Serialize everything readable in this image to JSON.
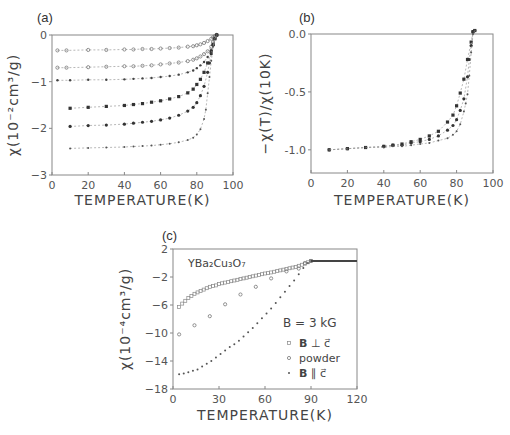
{
  "figure": {
    "panels": [
      {
        "id": "a",
        "label": "(a)"
      },
      {
        "id": "b",
        "label": "(b)"
      },
      {
        "id": "c",
        "label": "(c)"
      }
    ]
  },
  "chart_data": [
    {
      "id": "a",
      "type": "scatter",
      "title": "(a)",
      "xlabel": "TEMPERATURE(K)",
      "ylabel": "χ(10⁻²cm³/g)",
      "xlim": [
        0,
        100
      ],
      "ylim": [
        -3,
        0
      ],
      "xticks": [
        0,
        20,
        40,
        60,
        80,
        100
      ],
      "yticks": [
        0,
        -1,
        -2,
        -3
      ],
      "grid": false,
      "series": [
        {
          "name": "curve-1",
          "marker": "open-circle",
          "x": [
            3,
            8,
            20,
            30,
            40,
            45,
            50,
            55,
            60,
            65,
            70,
            75,
            78,
            80,
            82,
            84,
            86,
            88,
            89,
            90,
            91
          ],
          "y": [
            -0.33,
            -0.33,
            -0.32,
            -0.32,
            -0.31,
            -0.31,
            -0.3,
            -0.3,
            -0.29,
            -0.28,
            -0.27,
            -0.25,
            -0.24,
            -0.22,
            -0.2,
            -0.17,
            -0.13,
            -0.08,
            -0.05,
            -0.02,
            0.0
          ]
        },
        {
          "name": "curve-2",
          "marker": "open-circle",
          "x": [
            3,
            8,
            20,
            30,
            40,
            45,
            50,
            55,
            60,
            65,
            70,
            75,
            78,
            80,
            82,
            84,
            86,
            88,
            89,
            90,
            91
          ],
          "y": [
            -0.7,
            -0.7,
            -0.69,
            -0.68,
            -0.67,
            -0.67,
            -0.66,
            -0.65,
            -0.63,
            -0.61,
            -0.59,
            -0.56,
            -0.53,
            -0.5,
            -0.46,
            -0.41,
            -0.35,
            -0.25,
            -0.15,
            -0.05,
            0.0
          ]
        },
        {
          "name": "curve-3",
          "marker": "dot",
          "x": [
            3,
            10,
            20,
            30,
            40,
            45,
            50,
            55,
            60,
            65,
            70,
            75,
            78,
            80,
            82,
            84,
            86,
            88,
            89,
            90,
            91
          ],
          "y": [
            -0.97,
            -0.97,
            -0.96,
            -0.96,
            -0.95,
            -0.94,
            -0.93,
            -0.92,
            -0.9,
            -0.88,
            -0.85,
            -0.8,
            -0.76,
            -0.71,
            -0.65,
            -0.58,
            -0.47,
            -0.32,
            -0.2,
            -0.08,
            0.0
          ]
        },
        {
          "name": "curve-4",
          "marker": "filled-square",
          "x": [
            10,
            20,
            30,
            40,
            45,
            50,
            55,
            60,
            65,
            70,
            75,
            78,
            80,
            82,
            84,
            86,
            88,
            89,
            90,
            91
          ],
          "y": [
            -1.57,
            -1.55,
            -1.53,
            -1.51,
            -1.49,
            -1.47,
            -1.44,
            -1.41,
            -1.37,
            -1.32,
            -1.24,
            -1.16,
            -1.06,
            -0.95,
            -0.8,
            -0.6,
            -0.35,
            -0.2,
            -0.08,
            0.0
          ]
        },
        {
          "name": "curve-5",
          "marker": "filled-circle",
          "x": [
            10,
            20,
            30,
            40,
            45,
            50,
            55,
            60,
            65,
            70,
            75,
            78,
            80,
            82,
            84,
            86,
            87,
            88,
            89,
            90,
            91
          ],
          "y": [
            -1.96,
            -1.94,
            -1.93,
            -1.91,
            -1.89,
            -1.87,
            -1.85,
            -1.82,
            -1.78,
            -1.72,
            -1.63,
            -1.55,
            -1.45,
            -1.3,
            -1.1,
            -0.8,
            -0.6,
            -0.4,
            -0.22,
            -0.08,
            0.0
          ]
        },
        {
          "name": "curve-6",
          "marker": "small-dot",
          "x": [
            10,
            20,
            30,
            40,
            45,
            50,
            55,
            60,
            65,
            70,
            75,
            78,
            80,
            82,
            84,
            85,
            86,
            87,
            88,
            89,
            90,
            91
          ],
          "y": [
            -2.43,
            -2.42,
            -2.41,
            -2.4,
            -2.39,
            -2.38,
            -2.37,
            -2.35,
            -2.33,
            -2.3,
            -2.25,
            -2.2,
            -2.13,
            -2.02,
            -1.8,
            -1.6,
            -1.25,
            -0.9,
            -0.55,
            -0.25,
            -0.08,
            0.0
          ]
        }
      ]
    },
    {
      "id": "b",
      "type": "scatter",
      "title": "(b)",
      "xlabel": "TEMPERATURE(K)",
      "ylabel": "−χ(T)/χ(10K)",
      "xlim": [
        0,
        100
      ],
      "ylim": [
        -1.2,
        0.0
      ],
      "xticks": [
        0,
        20,
        40,
        60,
        80,
        100
      ],
      "yticks": [
        0.0,
        -0.5,
        -1.0
      ],
      "ytick_labels": [
        "0.0",
        "-0.5",
        "-1.0"
      ],
      "grid": false,
      "series": [
        {
          "name": "normalized-1",
          "marker": "filled-square",
          "x": [
            10,
            20,
            30,
            40,
            45,
            50,
            55,
            60,
            65,
            70,
            75,
            78,
            80,
            82,
            84,
            86,
            88,
            89,
            90
          ],
          "y": [
            -1.0,
            -0.99,
            -0.98,
            -0.97,
            -0.96,
            -0.95,
            -0.93,
            -0.91,
            -0.88,
            -0.84,
            -0.76,
            -0.7,
            -0.62,
            -0.51,
            -0.39,
            -0.22,
            -0.07,
            0.02,
            0.03
          ]
        },
        {
          "name": "normalized-2",
          "marker": "filled-circle",
          "x": [
            10,
            20,
            30,
            40,
            45,
            50,
            55,
            60,
            65,
            70,
            75,
            78,
            80,
            82,
            84,
            86,
            87,
            88,
            89,
            90
          ],
          "y": [
            -1.0,
            -0.99,
            -0.98,
            -0.97,
            -0.96,
            -0.96,
            -0.94,
            -0.93,
            -0.91,
            -0.88,
            -0.83,
            -0.79,
            -0.74,
            -0.66,
            -0.56,
            -0.37,
            -0.22,
            -0.1,
            0.02,
            0.03
          ]
        },
        {
          "name": "normalized-3",
          "marker": "small-dot",
          "x": [
            10,
            20,
            30,
            40,
            45,
            50,
            55,
            60,
            65,
            70,
            75,
            78,
            80,
            82,
            84,
            85,
            86,
            87,
            88,
            89,
            90
          ],
          "y": [
            -1.0,
            -0.99,
            -0.98,
            -0.98,
            -0.97,
            -0.97,
            -0.96,
            -0.95,
            -0.94,
            -0.92,
            -0.9,
            -0.87,
            -0.84,
            -0.78,
            -0.67,
            -0.6,
            -0.52,
            -0.36,
            -0.16,
            0.0,
            0.03
          ]
        }
      ]
    },
    {
      "id": "c",
      "type": "scatter",
      "title": "(c)",
      "annotation": "YBa₂Cu₃O₇",
      "xlabel": "TEMPERATURE(K)",
      "ylabel": "χ(10⁻⁴cm³/g)",
      "xlim": [
        0,
        120
      ],
      "ylim": [
        -18,
        2
      ],
      "xticks": [
        0,
        30,
        60,
        90,
        120
      ],
      "yticks": [
        2,
        -2,
        -6,
        -10,
        -14,
        -18
      ],
      "grid": false,
      "legend": {
        "title": "B = 3 kG",
        "position": "lower-right",
        "entries": [
          {
            "marker": "open-square",
            "label_bold": "B",
            "label_rest": " ⊥ c⃗"
          },
          {
            "marker": "open-circle",
            "label_bold": "",
            "label_rest": "powder"
          },
          {
            "marker": "small-dot",
            "label_bold": "B",
            "label_rest": " ∥ c⃗"
          }
        ]
      },
      "series": [
        {
          "name": "B ⊥ c",
          "marker": "open-square",
          "x": [
            4,
            6,
            8,
            10,
            12,
            14,
            16,
            18,
            20,
            22,
            24,
            26,
            28,
            30,
            32,
            34,
            36,
            38,
            40,
            42,
            44,
            46,
            48,
            50,
            52,
            54,
            56,
            58,
            60,
            62,
            64,
            66,
            68,
            70,
            72,
            74,
            76,
            78,
            80,
            82,
            84,
            86,
            88,
            90
          ],
          "y": [
            -6.3,
            -5.8,
            -5.4,
            -5.0,
            -4.7,
            -4.4,
            -4.2,
            -4.0,
            -3.8,
            -3.6,
            -3.4,
            -3.3,
            -3.2,
            -3.0,
            -2.9,
            -2.8,
            -2.7,
            -2.6,
            -2.5,
            -2.4,
            -2.3,
            -2.2,
            -2.1,
            -2.0,
            -1.9,
            -1.8,
            -1.7,
            -1.6,
            -1.5,
            -1.45,
            -1.35,
            -1.25,
            -1.15,
            -1.05,
            -0.95,
            -0.85,
            -0.75,
            -0.65,
            -0.55,
            -0.4,
            -0.25,
            -0.1,
            0.1,
            0.3
          ]
        },
        {
          "name": "powder",
          "marker": "open-circle",
          "x": [
            4,
            14,
            24,
            34,
            44,
            54,
            64,
            74,
            82,
            86,
            90
          ],
          "y": [
            -10.2,
            -8.9,
            -7.6,
            -5.9,
            -4.5,
            -3.4,
            -2.2,
            -1.2,
            -0.8,
            0.0,
            0.3
          ]
        },
        {
          "name": "B ∥ c",
          "marker": "small-dot",
          "x": [
            4,
            7,
            10,
            13,
            16,
            19,
            22,
            25,
            28,
            31,
            34,
            37,
            40,
            43,
            46,
            49,
            52,
            55,
            58,
            61,
            64,
            67,
            70,
            73,
            76,
            79,
            82,
            85,
            88,
            90
          ],
          "y": [
            -15.9,
            -15.8,
            -15.6,
            -15.4,
            -15.2,
            -14.8,
            -14.4,
            -14.0,
            -13.5,
            -13.0,
            -12.5,
            -12.0,
            -11.6,
            -11.1,
            -10.5,
            -9.9,
            -9.3,
            -8.6,
            -7.9,
            -7.2,
            -6.5,
            -5.7,
            -4.9,
            -4.1,
            -3.3,
            -2.5,
            -1.6,
            -0.7,
            0.0,
            0.3
          ]
        },
        {
          "name": "normal-state",
          "marker": "small-dot",
          "x": [
            90,
            92,
            94,
            96,
            98,
            100,
            102,
            104,
            106,
            108,
            110,
            112,
            114,
            116,
            118,
            120
          ],
          "y": [
            0.3,
            0.3,
            0.3,
            0.3,
            0.3,
            0.3,
            0.3,
            0.3,
            0.3,
            0.3,
            0.3,
            0.3,
            0.3,
            0.3,
            0.3,
            0.3
          ]
        }
      ]
    }
  ]
}
